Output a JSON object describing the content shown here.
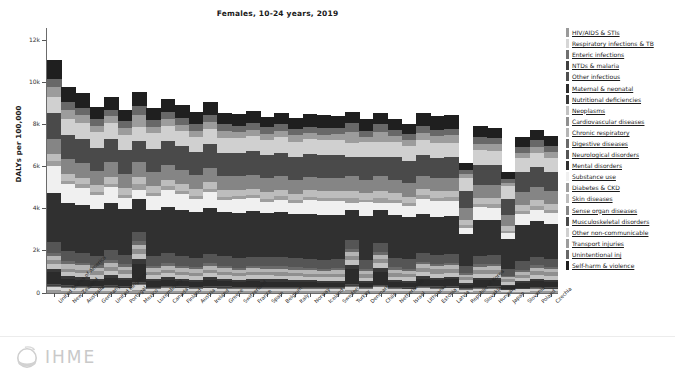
{
  "chart_data": {
    "type": "bar",
    "stacked": true,
    "title": "Females, 10-24 years, 2019",
    "xlabel": "",
    "ylabel": "DALYs per 100,000",
    "ylim": [
      0,
      12600
    ],
    "yticks": [
      0,
      2000,
      4000,
      6000,
      8000,
      10000,
      12000
    ],
    "ytick_labels": [
      "0",
      "2k",
      "4k",
      "6k",
      "8k",
      "10k",
      "12k"
    ],
    "grid": false,
    "legend_position": "right",
    "categories": [
      "United States of America",
      "New Zealand",
      "Australia",
      "Germany",
      "United Kingdom",
      "Portugal",
      "Mexico",
      "Luxembourg",
      "Canada",
      "Finland",
      "Austria",
      "Ireland",
      "Greece",
      "Switzerland",
      "France",
      "Spain",
      "Belgium",
      "Italy",
      "Norway",
      "Iceland",
      "Sweden",
      "Turkey",
      "Denmark",
      "Chile",
      "Netherlands",
      "Israel",
      "Lithuania",
      "Estonia",
      "Latvia",
      "Republic of Korea",
      "Slovakia",
      "Hungary",
      "Japan",
      "Slovenia",
      "Poland",
      "Czechia"
    ],
    "series": [
      {
        "name": "HIV/AIDS & STIs",
        "color": "#9a9a9a",
        "values": [
          125,
          110,
          100,
          96,
          108,
          92,
          150,
          88,
          96,
          90,
          86,
          92,
          88,
          82,
          86,
          84,
          86,
          82,
          80,
          78,
          80,
          120,
          78,
          110,
          80,
          76,
          92,
          86,
          90,
          62,
          84,
          86,
          56,
          72,
          80,
          74
        ]
      },
      {
        "name": "Respiratory infections & TB",
        "color": "#d6d6d6",
        "values": [
          175,
          150,
          140,
          132,
          150,
          128,
          210,
          124,
          136,
          126,
          120,
          130,
          126,
          116,
          122,
          118,
          120,
          116,
          114,
          110,
          112,
          180,
          110,
          160,
          112,
          108,
          140,
          128,
          134,
          96,
          126,
          128,
          88,
          108,
          120,
          110
        ]
      },
      {
        "name": "Enteric infections",
        "color": "#707070",
        "values": [
          45,
          38,
          36,
          34,
          38,
          34,
          62,
          32,
          34,
          32,
          30,
          34,
          32,
          30,
          30,
          30,
          30,
          30,
          28,
          28,
          28,
          48,
          28,
          44,
          28,
          28,
          36,
          34,
          34,
          26,
          32,
          32,
          22,
          28,
          30,
          28
        ]
      },
      {
        "name": "NTDs & malaria",
        "color": "#3f3f3f",
        "values": [
          34,
          28,
          26,
          25,
          28,
          24,
          44,
          24,
          26,
          24,
          22,
          26,
          24,
          22,
          24,
          22,
          22,
          22,
          22,
          20,
          22,
          36,
          20,
          32,
          22,
          20,
          28,
          26,
          26,
          18,
          24,
          24,
          16,
          20,
          24,
          22
        ]
      },
      {
        "name": "Other infectious",
        "color": "#4f4f4f",
        "values": [
          58,
          50,
          46,
          44,
          50,
          44,
          78,
          42,
          46,
          42,
          40,
          44,
          42,
          38,
          40,
          40,
          40,
          38,
          38,
          36,
          38,
          64,
          36,
          56,
          38,
          36,
          48,
          44,
          46,
          32,
          42,
          42,
          28,
          36,
          40,
          38
        ]
      },
      {
        "name": "Maternal & neonatal",
        "color": "#2b2b2b",
        "values": [
          560,
          300,
          280,
          240,
          360,
          300,
          860,
          260,
          300,
          250,
          235,
          300,
          250,
          225,
          250,
          255,
          245,
          230,
          220,
          210,
          215,
          700,
          205,
          620,
          225,
          215,
          330,
          300,
          315,
          150,
          290,
          300,
          130,
          205,
          280,
          245
        ]
      },
      {
        "name": "Nutritional deficiencies",
        "color": "#383838",
        "values": [
          150,
          125,
          118,
          110,
          128,
          118,
          225,
          108,
          118,
          110,
          105,
          118,
          112,
          100,
          108,
          108,
          106,
          102,
          98,
          94,
          96,
          190,
          92,
          170,
          100,
          94,
          130,
          120,
          124,
          78,
          116,
          118,
          62,
          92,
          112,
          104
        ]
      },
      {
        "name": "Neoplasms",
        "color": "#c2c2c2",
        "values": [
          215,
          200,
          190,
          186,
          195,
          190,
          250,
          182,
          190,
          184,
          180,
          190,
          186,
          178,
          184,
          182,
          184,
          180,
          176,
          172,
          176,
          230,
          172,
          225,
          180,
          174,
          200,
          192,
          196,
          158,
          188,
          190,
          148,
          172,
          186,
          180
        ]
      },
      {
        "name": "Cardiovascular diseases",
        "color": "#8f8f8f",
        "values": [
          195,
          165,
          158,
          165,
          168,
          158,
          230,
          155,
          162,
          158,
          152,
          160,
          158,
          150,
          155,
          154,
          156,
          152,
          148,
          144,
          148,
          215,
          144,
          205,
          152,
          146,
          205,
          196,
          200,
          128,
          190,
          194,
          112,
          150,
          190,
          182
        ]
      },
      {
        "name": "Chronic respiratory",
        "color": "#b5b5b5",
        "values": [
          220,
          235,
          230,
          180,
          225,
          175,
          190,
          178,
          200,
          180,
          172,
          205,
          175,
          168,
          172,
          170,
          180,
          166,
          168,
          164,
          168,
          175,
          162,
          180,
          178,
          168,
          165,
          158,
          162,
          118,
          152,
          156,
          102,
          140,
          150,
          146
        ]
      },
      {
        "name": "Digestive diseases",
        "color": "#6a6a6a",
        "values": [
          130,
          115,
          110,
          108,
          115,
          112,
          165,
          106,
          112,
          108,
          104,
          112,
          110,
          102,
          106,
          106,
          108,
          104,
          100,
          98,
          100,
          150,
          98,
          142,
          104,
          100,
          128,
          120,
          124,
          84,
          118,
          120,
          72,
          96,
          116,
          110
        ]
      },
      {
        "name": "Neurological disorders",
        "color": "#555555",
        "values": [
          530,
          480,
          470,
          455,
          475,
          455,
          420,
          450,
          465,
          455,
          445,
          465,
          455,
          440,
          450,
          448,
          452,
          442,
          436,
          430,
          434,
          410,
          428,
          415,
          445,
          434,
          420,
          410,
          414,
          360,
          404,
          408,
          330,
          400,
          405,
          398
        ]
      },
      {
        "name": "Mental disorders",
        "color": "#303030",
        "values": [
          2340,
          2300,
          2290,
          2200,
          2250,
          2150,
          1600,
          2180,
          2220,
          2200,
          2160,
          2190,
          2120,
          2140,
          2160,
          2110,
          2120,
          2090,
          2130,
          2120,
          2110,
          1450,
          2080,
          1580,
          2040,
          2000,
          1850,
          1820,
          1800,
          1500,
          1720,
          1700,
          1420,
          1720,
          1680,
          1640
        ]
      },
      {
        "name": "Substance use",
        "color": "#f0f0f0",
        "values": [
          1280,
          880,
          820,
          690,
          760,
          560,
          420,
          700,
          820,
          760,
          640,
          740,
          540,
          660,
          620,
          520,
          600,
          520,
          680,
          700,
          660,
          300,
          660,
          360,
          580,
          520,
          700,
          740,
          720,
          300,
          600,
          560,
          260,
          520,
          560,
          520
        ]
      },
      {
        "name": "Diabetes & CKD",
        "color": "#9e9e9e",
        "values": [
          210,
          160,
          155,
          150,
          158,
          150,
          290,
          148,
          155,
          150,
          146,
          152,
          150,
          144,
          148,
          148,
          150,
          146,
          142,
          140,
          142,
          270,
          138,
          245,
          146,
          142,
          175,
          168,
          170,
          118,
          160,
          164,
          102,
          136,
          158,
          152
        ]
      },
      {
        "name": "Skin diseases",
        "color": "#bdbdbd",
        "values": [
          340,
          330,
          325,
          318,
          325,
          318,
          330,
          315,
          322,
          318,
          312,
          320,
          316,
          310,
          315,
          312,
          316,
          310,
          306,
          302,
          304,
          325,
          300,
          320,
          312,
          306,
          300,
          294,
          296,
          250,
          288,
          290,
          235,
          286,
          288,
          282
        ]
      },
      {
        "name": "Sense organ diseases",
        "color": "#858585",
        "values": [
          700,
          690,
          685,
          670,
          680,
          668,
          710,
          665,
          676,
          670,
          662,
          672,
          666,
          658,
          664,
          660,
          664,
          656,
          652,
          646,
          650,
          700,
          644,
          690,
          660,
          652,
          640,
          630,
          634,
          560,
          620,
          624,
          530,
          614,
          618,
          608
        ]
      },
      {
        "name": "Musculoskeletal disorders",
        "color": "#4a4a4a",
        "values": [
          1250,
          1180,
          1160,
          1120,
          1140,
          1110,
          980,
          1115,
          1135,
          1120,
          1100,
          1125,
          1105,
          1095,
          1110,
          1095,
          1105,
          1085,
          1090,
          1080,
          1085,
          900,
          1075,
          930,
          1070,
          1055,
          990,
          975,
          980,
          820,
          960,
          955,
          780,
          945,
          950,
          935
        ]
      },
      {
        "name": "Other non-communicable",
        "color": "#d0d0d0",
        "values": [
          780,
          760,
          755,
          740,
          748,
          735,
          700,
          738,
          748,
          740,
          732,
          742,
          736,
          728,
          736,
          730,
          734,
          726,
          722,
          716,
          720,
          690,
          714,
          700,
          728,
          720,
          690,
          680,
          684,
          600,
          672,
          676,
          580,
          666,
          670,
          660
        ]
      },
      {
        "name": "Transport injuries",
        "color": "#9c9c9c",
        "values": [
          470,
          400,
          370,
          290,
          300,
          330,
          560,
          310,
          330,
          300,
          290,
          320,
          340,
          270,
          300,
          290,
          290,
          300,
          260,
          250,
          255,
          520,
          250,
          480,
          255,
          280,
          360,
          340,
          350,
          190,
          320,
          310,
          150,
          250,
          300,
          280
        ]
      },
      {
        "name": "Unintentional inj",
        "color": "#686868",
        "values": [
          400,
          370,
          355,
          320,
          330,
          330,
          430,
          325,
          345,
          330,
          318,
          340,
          330,
          310,
          322,
          318,
          320,
          315,
          308,
          300,
          304,
          420,
          298,
          400,
          315,
          305,
          330,
          320,
          324,
          230,
          312,
          315,
          200,
          290,
          310,
          300
        ]
      },
      {
        "name": "Self-harm & violence",
        "color": "#1f1f1f",
        "values": [
          890,
          760,
          700,
          560,
          600,
          540,
          640,
          580,
          620,
          600,
          550,
          600,
          520,
          540,
          560,
          500,
          520,
          500,
          580,
          620,
          590,
          520,
          560,
          520,
          500,
          480,
          620,
          640,
          630,
          320,
          520,
          480,
          340,
          480,
          500,
          460
        ]
      }
    ]
  },
  "footer": {
    "logo_text": "IHME"
  },
  "icons": {
    "logo_mark": "ihme-globe-icon"
  }
}
